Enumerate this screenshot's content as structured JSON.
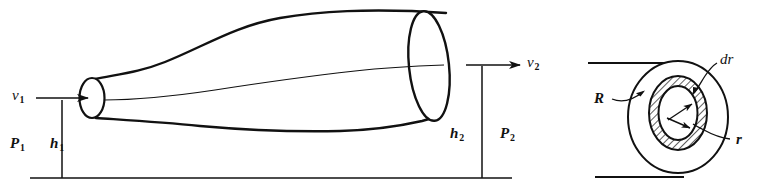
{
  "figure": {
    "ink_color": "#111111",
    "background_color": "#ffffff",
    "panels": [
      {
        "name": "flow-tube-panel",
        "description": "Tapered stream tube widening from small inlet at left to large outlet at right, above a horizontal datum line"
      },
      {
        "name": "annulus-panel",
        "description": "Circular pipe cross section with hatched annular ring of radius r and thickness dr inside outer radius R"
      }
    ]
  },
  "labels": {
    "v1": {
      "base": "v",
      "sub": "1"
    },
    "v2": {
      "base": "v",
      "sub": "2"
    },
    "p1": {
      "base": "P",
      "sub": "1"
    },
    "p2": {
      "base": "P",
      "sub": "2"
    },
    "h1": {
      "base": "h",
      "sub": "1"
    },
    "h2": {
      "base": "h",
      "sub": "2"
    },
    "R": {
      "base": "R",
      "sub": ""
    },
    "r": {
      "base": "r",
      "sub": ""
    },
    "dr": {
      "base": "dr",
      "sub": ""
    }
  }
}
